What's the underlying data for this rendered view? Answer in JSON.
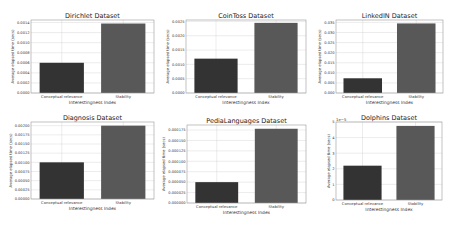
{
  "chart_data": [
    {
      "type": "bar",
      "title": "Dirichlet Dataset",
      "xlabel": "Interestingness Index",
      "ylabel": "Average elapsed time (secs)",
      "categories": [
        "Conceptual relevance",
        "Stability"
      ],
      "values": [
        0.0006,
        0.00138
      ],
      "ylim": [
        0,
        0.00145
      ],
      "yticks": [
        "0.0000",
        "0.0002",
        "0.0004",
        "0.0006",
        "0.0008",
        "0.0010",
        "0.0012",
        "0.0014"
      ],
      "ytick_values": [
        0,
        0.0002,
        0.0004,
        0.0006,
        0.0008,
        0.001,
        0.0012,
        0.0014
      ],
      "offset_label": "",
      "grid": true
    },
    {
      "type": "bar",
      "title": "CoinToss Dataset",
      "xlabel": "Interestingness Index",
      "ylabel": "Average elapsed time (secs)",
      "categories": [
        "Conceptual relevance",
        "Stability"
      ],
      "values": [
        0.0012,
        0.00245
      ],
      "ylim": [
        0,
        0.00255
      ],
      "yticks": [
        "0.0000",
        "0.0005",
        "0.0010",
        "0.0015",
        "0.0020",
        "0.0025"
      ],
      "ytick_values": [
        0,
        0.0005,
        0.001,
        0.0015,
        0.002,
        0.0025
      ],
      "offset_label": "",
      "grid": true
    },
    {
      "type": "bar",
      "title": "LinkedIN Dataset",
      "xlabel": "Interestingness Index",
      "ylabel": "Average elapsed time (secs)",
      "categories": [
        "Conceptual relevance",
        "Stability"
      ],
      "values": [
        0.0073,
        0.0345
      ],
      "ylim": [
        0,
        0.0362
      ],
      "yticks": [
        "0.000",
        "0.005",
        "0.010",
        "0.015",
        "0.020",
        "0.025",
        "0.030",
        "0.035"
      ],
      "ytick_values": [
        0,
        0.005,
        0.01,
        0.015,
        0.02,
        0.025,
        0.03,
        0.035
      ],
      "offset_label": "",
      "grid": true
    },
    {
      "type": "bar",
      "title": "Diagnosis Dataset",
      "xlabel": "Interestingness Index",
      "ylabel": "Average elapsed time (secs)",
      "categories": [
        "Conceptual relevance",
        "Stability"
      ],
      "values": [
        0.001,
        0.002
      ],
      "ylim": [
        0,
        0.0021
      ],
      "yticks": [
        "0.00000",
        "0.00025",
        "0.00050",
        "0.00075",
        "0.00100",
        "0.00125",
        "0.00150",
        "0.00175",
        "0.00200"
      ],
      "ytick_values": [
        0,
        0.00025,
        0.0005,
        0.00075,
        0.001,
        0.00125,
        0.0015,
        0.00175,
        0.002
      ],
      "offset_label": "",
      "grid": true
    },
    {
      "type": "bar",
      "title": "PediaLanguages Dataset",
      "xlabel": "Interestingness Index",
      "ylabel": "Average elapsed time (secs)",
      "categories": [
        "Conceptual relevance",
        "Stability"
      ],
      "values": [
        5e-05,
        0.000178
      ],
      "ylim": [
        0,
        0.000187
      ],
      "yticks": [
        "0.000000",
        "0.000025",
        "0.000050",
        "0.000075",
        "0.000100",
        "0.000125",
        "0.000150",
        "0.000175"
      ],
      "ytick_values": [
        0,
        2.5e-05,
        5e-05,
        7.5e-05,
        0.0001,
        0.000125,
        0.00015,
        0.000175
      ],
      "offset_label": "",
      "grid": true
    },
    {
      "type": "bar",
      "title": "Dolphins Dataset",
      "xlabel": "Interestingness Index",
      "ylabel": "Average elapsed time (secs)",
      "categories": [
        "Conceptual relevance",
        "Stability"
      ],
      "values": [
        2.2,
        4.75
      ],
      "ylim": [
        0,
        5
      ],
      "yticks": [
        "0",
        "1",
        "2",
        "3",
        "4",
        "5"
      ],
      "ytick_values": [
        0,
        1,
        2,
        3,
        4,
        5
      ],
      "offset_label": "1e−5",
      "grid": true
    }
  ],
  "colors": {
    "conceptual_bar": "#333333",
    "stability_bar": "#585858",
    "grid": "#cfcfcf",
    "frame": "#999999"
  }
}
